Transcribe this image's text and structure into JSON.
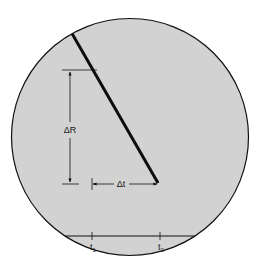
{
  "diagram": {
    "type": "scope-trace-slope",
    "background": "#ffffff",
    "circle_fill": "#d2d2d2",
    "stroke_color": "#111111",
    "labels": {
      "delta_r": "ΔR",
      "delta_t": "Δt",
      "t1": "t",
      "t1_sub": "1",
      "t2": "t",
      "t2_sub": "2"
    }
  }
}
